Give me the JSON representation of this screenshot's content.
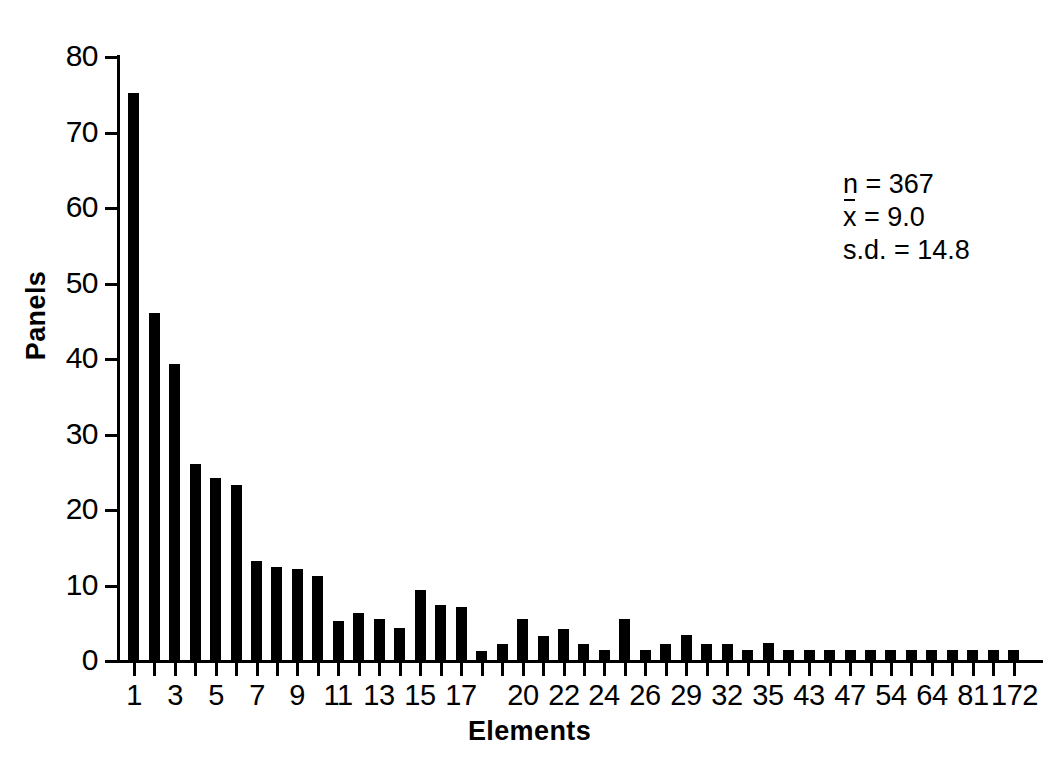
{
  "chart_data": {
    "type": "bar",
    "title": "",
    "subtitle": "",
    "xlabel": "Elements",
    "ylabel": "Panels",
    "ylim": [
      0,
      80
    ],
    "yticks": [
      0,
      10,
      20,
      30,
      40,
      50,
      60,
      70,
      80
    ],
    "grid": false,
    "legend": null,
    "bar_color": "#000000",
    "background_color": "#ffffff",
    "categories": [
      "1",
      "2",
      "3",
      "4",
      "5",
      "6",
      "7",
      "8",
      "9",
      "10",
      "11",
      "12",
      "13",
      "14",
      "15",
      "16",
      "17",
      "18",
      "19",
      "20",
      "21",
      "22",
      "23",
      "24",
      "25",
      "26",
      "27",
      "29",
      "30",
      "32",
      "33",
      "35",
      "38",
      "43",
      "45",
      "47",
      "50",
      "54",
      "57",
      "64",
      "72",
      "81",
      "105",
      "172"
    ],
    "xtick_labels": [
      "1",
      "",
      "3",
      "",
      "5",
      "",
      "7",
      "",
      "9",
      "",
      "11",
      "",
      "13",
      "",
      "15",
      "",
      "17",
      "",
      "",
      "20",
      "",
      "22",
      "",
      "24",
      "",
      "26",
      "",
      "29",
      "",
      "32",
      "",
      "35",
      "",
      "43",
      "",
      "47",
      "",
      "54",
      "",
      "64",
      "",
      "81",
      "",
      "172"
    ],
    "values": [
      75.2,
      46.1,
      39.3,
      26.1,
      24.2,
      23.3,
      13.2,
      12.4,
      12.2,
      11.3,
      5.3,
      6.3,
      5.6,
      4.4,
      9.4,
      7.4,
      7.2,
      1.3,
      2.2,
      5.5,
      3.3,
      4.2,
      2.2,
      1.5,
      5.5,
      1.4,
      2.3,
      3.4,
      2.3,
      2.2,
      1.4,
      2.4,
      1.4,
      1.5,
      1.4,
      1.5,
      1.4,
      1.5,
      1.4,
      1.4,
      1.4,
      1.5,
      1.5,
      1.4
    ],
    "annotations": {
      "n_label": "n = 367",
      "mean_label": "= 9.0",
      "mean_symbol": "x",
      "sd_label": "s.d. = 14.8"
    },
    "n": 367,
    "mean": 9.0,
    "sd": 14.8
  }
}
